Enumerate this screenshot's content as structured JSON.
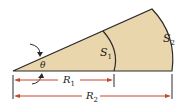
{
  "diagram": {
    "type": "circular-sector-annulus",
    "labels": {
      "angle": "θ",
      "inner_arc": "S",
      "inner_arc_sub": "1",
      "outer_arc": "S",
      "outer_arc_sub": "2",
      "inner_radius": "R",
      "inner_radius_sub": "1",
      "outer_radius": "R",
      "outer_radius_sub": "2"
    },
    "colors": {
      "fill": "#ead6ad",
      "stroke": "#2a2a2a",
      "dimension": "#c8462c"
    }
  }
}
